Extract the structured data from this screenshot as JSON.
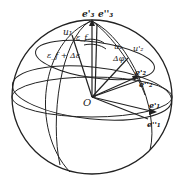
{
  "diagram": {
    "type": "sphere-rotation-diagram",
    "labels": {
      "e3p": "e'₃",
      "e3pp": "e''₃",
      "u1": "u₁",
      "ef": "ε_f",
      "ef_de": "ε_f + Δε",
      "u2": "u₂",
      "u2p": "u'₂",
      "dphi": "Δφ",
      "e2p": "e'₂",
      "e2pp": "e''₂",
      "origin": "O",
      "e1p": "e'₁",
      "e1pp": "e''₁"
    },
    "colors": {
      "stroke": "#222222",
      "background": "#ffffff"
    }
  }
}
